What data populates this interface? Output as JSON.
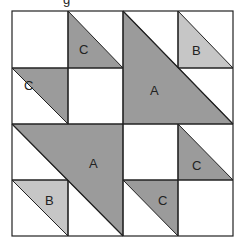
{
  "diagram": {
    "title_fragment": "g",
    "colors": {
      "dark_fill": "#9b9b9b",
      "light_fill": "#c6c6c6",
      "background": "#ffffff",
      "stroke": "#222222"
    },
    "grid": {
      "rows": 4,
      "cols": 4
    },
    "pieces": [
      {
        "id": "C-top-1",
        "label": "C",
        "shade": "dark"
      },
      {
        "id": "C-top-2",
        "label": "C",
        "shade": "dark"
      },
      {
        "id": "A-top",
        "label": "A",
        "shade": "dark"
      },
      {
        "id": "B-top",
        "label": "B",
        "shade": "light"
      },
      {
        "id": "A-bottom",
        "label": "A",
        "shade": "dark"
      },
      {
        "id": "B-bottom",
        "label": "B",
        "shade": "light"
      },
      {
        "id": "C-bottom-1",
        "label": "C",
        "shade": "dark"
      },
      {
        "id": "C-bottom-2",
        "label": "C",
        "shade": "dark"
      }
    ]
  }
}
